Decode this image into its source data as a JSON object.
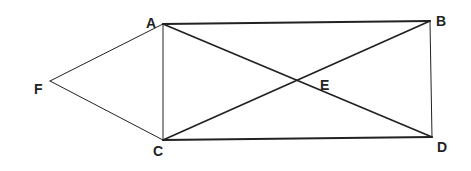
{
  "diagram": {
    "type": "geometry",
    "stroke_color": "#222222",
    "background": "#ffffff",
    "points": {
      "A": {
        "label": "A",
        "x": 163,
        "y": 24
      },
      "B": {
        "label": "B",
        "x": 430,
        "y": 21
      },
      "C": {
        "label": "C",
        "x": 163,
        "y": 140
      },
      "D": {
        "label": "D",
        "x": 432,
        "y": 137
      },
      "E": {
        "label": "E",
        "x": 297,
        "y": 80
      },
      "F": {
        "label": "F",
        "x": 50,
        "y": 81
      }
    },
    "segments": [
      {
        "from": "A",
        "to": "B"
      },
      {
        "from": "B",
        "to": "D"
      },
      {
        "from": "C",
        "to": "D"
      },
      {
        "from": "A",
        "to": "C"
      },
      {
        "from": "A",
        "to": "D"
      },
      {
        "from": "C",
        "to": "B"
      },
      {
        "from": "F",
        "to": "A"
      },
      {
        "from": "F",
        "to": "C"
      }
    ],
    "labels": {
      "A": "A",
      "B": "B",
      "C": "C",
      "D": "D",
      "E": "E",
      "F": "F"
    }
  }
}
